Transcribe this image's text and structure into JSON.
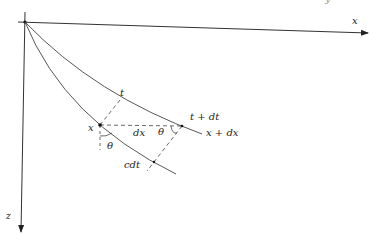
{
  "diagram": {
    "axes": {
      "x_label": "x",
      "z_label": "z"
    },
    "points": {
      "start": "x",
      "end": "x + dx"
    },
    "wavefronts": {
      "upper": "t",
      "upper_shifted": "t + dt"
    },
    "segments": {
      "horizontal": "dx",
      "ray_path": "cdt"
    },
    "angles": {
      "at_start": "θ",
      "at_end": "θ"
    },
    "top_right_fragment": "y \""
  }
}
